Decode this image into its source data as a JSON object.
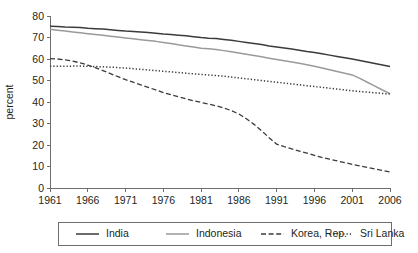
{
  "chart_data": {
    "type": "line",
    "title": "",
    "subtitle": "",
    "xlabel": "",
    "ylabel": "percent",
    "xlim": [
      1961,
      2006
    ],
    "ylim": [
      0,
      80
    ],
    "grid": false,
    "legend_position": "bottom",
    "x_ticks": [
      "1961",
      "1966",
      "1971",
      "1976",
      "1981",
      "1986",
      "1991",
      "1996",
      "2001",
      "2006"
    ],
    "y_ticks": [
      "0",
      "10",
      "20",
      "30",
      "40",
      "50",
      "60",
      "70",
      "80"
    ],
    "x": [
      1961,
      1962,
      1963,
      1964,
      1965,
      1966,
      1967,
      1968,
      1969,
      1970,
      1971,
      1972,
      1973,
      1974,
      1975,
      1976,
      1977,
      1978,
      1979,
      1980,
      1981,
      1982,
      1983,
      1984,
      1985,
      1986,
      1987,
      1988,
      1989,
      1990,
      1991,
      1992,
      1993,
      1994,
      1995,
      1996,
      1997,
      1998,
      1999,
      2000,
      2001,
      2002,
      2003,
      2004,
      2005,
      2006
    ],
    "series": [
      {
        "name": "India",
        "style": "solid",
        "color": "#3b3b3b",
        "values": [
          75.2,
          75.1,
          74.9,
          74.8,
          74.6,
          74.3,
          74.1,
          73.9,
          73.6,
          73.3,
          73.0,
          72.8,
          72.6,
          72.3,
          72.0,
          71.6,
          71.4,
          71.1,
          70.8,
          70.4,
          70.0,
          69.7,
          69.5,
          69.1,
          68.7,
          68.2,
          67.7,
          67.2,
          66.7,
          66.1,
          65.6,
          65.1,
          64.6,
          64.1,
          63.5,
          63.0,
          62.4,
          61.8,
          61.2,
          60.6,
          60.0,
          59.3,
          58.6,
          57.9,
          57.2,
          56.5
        ]
      },
      {
        "name": "Indonesia",
        "style": "solid",
        "color": "#9a9a9a",
        "values": [
          73.8,
          73.4,
          73.0,
          72.6,
          72.2,
          71.8,
          71.4,
          71.0,
          70.6,
          70.2,
          69.8,
          69.4,
          69.0,
          68.6,
          68.2,
          67.7,
          67.2,
          66.6,
          66.1,
          65.6,
          65.0,
          64.8,
          64.4,
          63.9,
          63.4,
          62.8,
          62.2,
          61.6,
          61.0,
          60.4,
          59.8,
          59.2,
          58.6,
          58.0,
          57.3,
          56.6,
          55.8,
          55.0,
          54.2,
          53.4,
          52.6,
          51.0,
          49.2,
          47.4,
          45.6,
          43.9
        ]
      },
      {
        "name": "Korea, Rep.",
        "style": "dashed",
        "color": "#3b3b3b",
        "values": [
          60.2,
          60.0,
          59.6,
          59.0,
          58.2,
          57.2,
          56.0,
          54.6,
          53.2,
          51.8,
          50.4,
          49.2,
          48.0,
          46.8,
          45.6,
          44.4,
          43.4,
          42.4,
          41.5,
          40.6,
          39.8,
          39.0,
          38.2,
          37.2,
          36.0,
          34.4,
          32.2,
          29.6,
          26.6,
          23.4,
          20.4,
          19.2,
          18.2,
          17.2,
          16.2,
          15.2,
          14.2,
          13.4,
          12.6,
          11.8,
          11.0,
          10.3,
          9.6,
          8.9,
          8.2,
          7.5
        ]
      },
      {
        "name": "Sri Lanka",
        "style": "dotted",
        "color": "#3b3b3b",
        "values": [
          56.6,
          56.6,
          56.6,
          56.7,
          56.7,
          56.6,
          56.5,
          56.4,
          56.2,
          56.0,
          55.8,
          55.5,
          55.2,
          54.9,
          54.6,
          54.3,
          54.0,
          53.7,
          53.4,
          53.1,
          52.8,
          52.6,
          52.3,
          52.0,
          51.6,
          51.2,
          50.8,
          50.4,
          50.0,
          49.6,
          49.2,
          48.8,
          48.4,
          48.0,
          47.6,
          47.2,
          46.8,
          46.4,
          46.0,
          45.6,
          45.2,
          44.9,
          44.6,
          44.3,
          44.0,
          43.7
        ]
      }
    ]
  },
  "legend": {
    "entries": [
      {
        "label": "India"
      },
      {
        "label": "Indonesia"
      },
      {
        "label": "Korea, Rep."
      },
      {
        "label": "Sri Lanka"
      }
    ]
  }
}
